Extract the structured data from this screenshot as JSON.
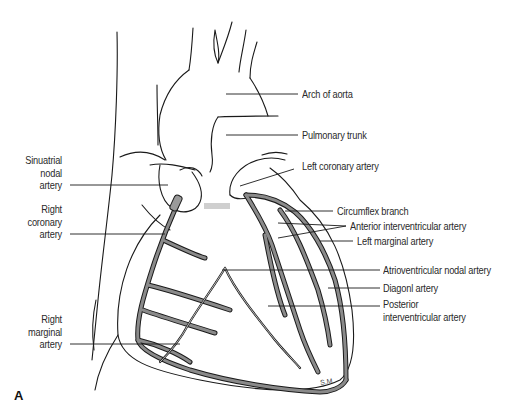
{
  "figure": {
    "panel_letter": "A",
    "signature": "S.M.",
    "colors": {
      "outline": "#1a1a1a",
      "vessel_fill": "#8a8a8a",
      "background": "#ffffff",
      "text": "#2a2a2a"
    }
  },
  "labels": {
    "left": [
      {
        "id": "sinuatrial",
        "lines": [
          "Sinuatrial",
          "nodal",
          "artery"
        ]
      },
      {
        "id": "right-coronary",
        "lines": [
          "Right",
          "coronary",
          "artery"
        ]
      },
      {
        "id": "right-marginal",
        "lines": [
          "Right",
          "marginal",
          "artery"
        ]
      }
    ],
    "right": [
      {
        "id": "arch-of-aorta",
        "text": "Arch of aorta"
      },
      {
        "id": "pulmonary-trunk",
        "text": "Pulmonary trunk"
      },
      {
        "id": "left-coronary",
        "text": "Left coronary artery"
      },
      {
        "id": "circumflex",
        "text": "Circumflex branch"
      },
      {
        "id": "anterior-interventricular",
        "text": "Anterior interventricular artery"
      },
      {
        "id": "left-marginal",
        "text": "Left marginal artery"
      },
      {
        "id": "av-nodal",
        "text": "Atrioventricular nodal artery"
      },
      {
        "id": "diagonal",
        "text": "Diagonl artery"
      },
      {
        "id": "posterior-interventricular",
        "lines": [
          "Posterior",
          "interventricular artery"
        ]
      }
    ]
  }
}
